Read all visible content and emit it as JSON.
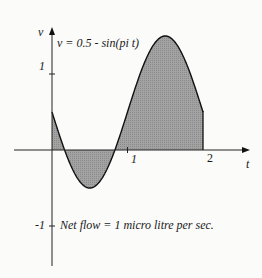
{
  "chart_data": {
    "type": "area",
    "title": "",
    "equation": "v = 0.5 - sin(pi t)",
    "xlabel": "t",
    "ylabel": "v",
    "x_ticks": [
      "1",
      "2"
    ],
    "y_ticks": [
      "1",
      "-1"
    ],
    "xlim": [
      0,
      2
    ],
    "ylim": [
      -1,
      1.5
    ],
    "grid": false,
    "annotation": "Net flow = 1 micro litre per sec.",
    "series": [
      {
        "name": "v",
        "x": [
          0,
          0.1667,
          0.25,
          0.5,
          0.75,
          0.8333,
          1,
          1.25,
          1.5,
          1.75,
          2
        ],
        "values": [
          0.5,
          0,
          -0.207,
          -0.5,
          -0.207,
          0,
          0.5,
          1.207,
          1.5,
          1.207,
          0.5
        ]
      }
    ],
    "fill": "shaded area between curve and t-axis from t=0 to t=2",
    "colors": {
      "fill": "#9a9a9a",
      "line": "#111111",
      "background": "#fbfbfa"
    }
  },
  "labels": {
    "y_axis": "v",
    "x_axis": "t",
    "equation": "v = 0.5 - sin(pi t)",
    "tick_y_1": "1",
    "tick_y_neg1": "-1",
    "tick_x_1": "1",
    "tick_x_2": "2",
    "annotation": "Net flow = 1 micro litre per sec."
  }
}
